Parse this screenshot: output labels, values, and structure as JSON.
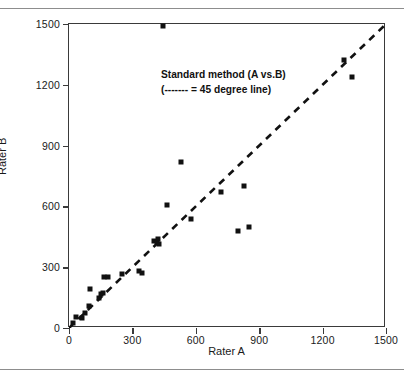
{
  "figure": {
    "has_top_rule": true,
    "has_bottom_rule": true
  },
  "annotation": {
    "line1": "Standard method (A vs.B)",
    "line2": "(------- = 45 degree line)"
  },
  "chart_data": {
    "type": "scatter",
    "title": "",
    "xlabel": "Rater A",
    "ylabel": "Rater B",
    "xlim": [
      0,
      1500
    ],
    "ylim": [
      0,
      1500
    ],
    "xticks": [
      0,
      300,
      600,
      900,
      1200,
      1500
    ],
    "yticks": [
      0,
      300,
      600,
      900,
      1200,
      1500
    ],
    "xticklabels": [
      "0",
      "300",
      "600",
      "900",
      "1200",
      "1500"
    ],
    "yticklabels": [
      "0",
      "300",
      "600",
      "900",
      "1200",
      "1500"
    ],
    "grid": false,
    "legend": "none",
    "marker": "square",
    "marker_color": "#111111",
    "reference_line": {
      "label": "45 degree line",
      "style": "dashed",
      "color": "#111111",
      "from": [
        0,
        0
      ],
      "to": [
        1500,
        1500
      ]
    },
    "points": [
      {
        "x": 20,
        "y": 25
      },
      {
        "x": 35,
        "y": 55
      },
      {
        "x": 60,
        "y": 50
      },
      {
        "x": 75,
        "y": 75
      },
      {
        "x": 95,
        "y": 110
      },
      {
        "x": 100,
        "y": 190
      },
      {
        "x": 140,
        "y": 150
      },
      {
        "x": 150,
        "y": 170
      },
      {
        "x": 160,
        "y": 175
      },
      {
        "x": 165,
        "y": 250
      },
      {
        "x": 185,
        "y": 250
      },
      {
        "x": 250,
        "y": 265
      },
      {
        "x": 330,
        "y": 280
      },
      {
        "x": 345,
        "y": 270
      },
      {
        "x": 400,
        "y": 430
      },
      {
        "x": 415,
        "y": 425
      },
      {
        "x": 420,
        "y": 440
      },
      {
        "x": 425,
        "y": 415
      },
      {
        "x": 445,
        "y": 1490
      },
      {
        "x": 465,
        "y": 605
      },
      {
        "x": 530,
        "y": 820
      },
      {
        "x": 575,
        "y": 540
      },
      {
        "x": 720,
        "y": 670
      },
      {
        "x": 800,
        "y": 480
      },
      {
        "x": 830,
        "y": 700
      },
      {
        "x": 850,
        "y": 500
      },
      {
        "x": 1300,
        "y": 1320
      },
      {
        "x": 1340,
        "y": 1240
      }
    ]
  }
}
